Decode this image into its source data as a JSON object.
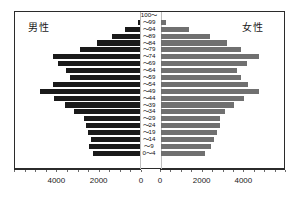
{
  "labels": {
    "male": "男性",
    "female": "女性"
  },
  "colors": {
    "male_bar": "#1a1a1a",
    "female_bar": "#707070",
    "frame": "#2b2b2b",
    "background": "#ffffff"
  },
  "axis": {
    "left_ticks": [
      "4000",
      "2000",
      "0"
    ],
    "right_ticks": [
      "0",
      "2000",
      "4000"
    ],
    "max": 6000,
    "tick_step": 2000,
    "minor_step": 500
  },
  "chart_data": {
    "type": "bar",
    "title": "",
    "subtitle": "",
    "xlabel": "",
    "ylabel": "",
    "orientation": "horizontal",
    "layout": "population-pyramid",
    "grid": false,
    "legend_position": "in-plot-corners",
    "xlim": [
      0,
      6000
    ],
    "axis_direction": {
      "left": "descending-to-center",
      "right": "ascending-from-center"
    },
    "categories": [
      "100～",
      "～99",
      "～94",
      "～89",
      "～84",
      "～79",
      "～74",
      "～69",
      "～64",
      "～59",
      "～54",
      "～49",
      "～44",
      "～39",
      "～34",
      "～29",
      "～24",
      "～19",
      "～14",
      "～9",
      "0～4"
    ],
    "series": [
      {
        "name": "男性",
        "side": "left",
        "color": "#1a1a1a",
        "values": [
          0,
          120,
          700,
          1350,
          2050,
          2900,
          4200,
          3950,
          3550,
          3350,
          4200,
          4800,
          4150,
          3600,
          3150,
          2700,
          2600,
          2500,
          2350,
          2450,
          2250
        ]
      },
      {
        "name": "女性",
        "side": "right",
        "color": "#707070",
        "values": [
          0,
          250,
          1350,
          2400,
          3200,
          3900,
          4800,
          4200,
          3700,
          3900,
          4250,
          4800,
          4050,
          3550,
          3100,
          2900,
          2900,
          2750,
          2600,
          2450,
          2150
        ]
      }
    ]
  }
}
